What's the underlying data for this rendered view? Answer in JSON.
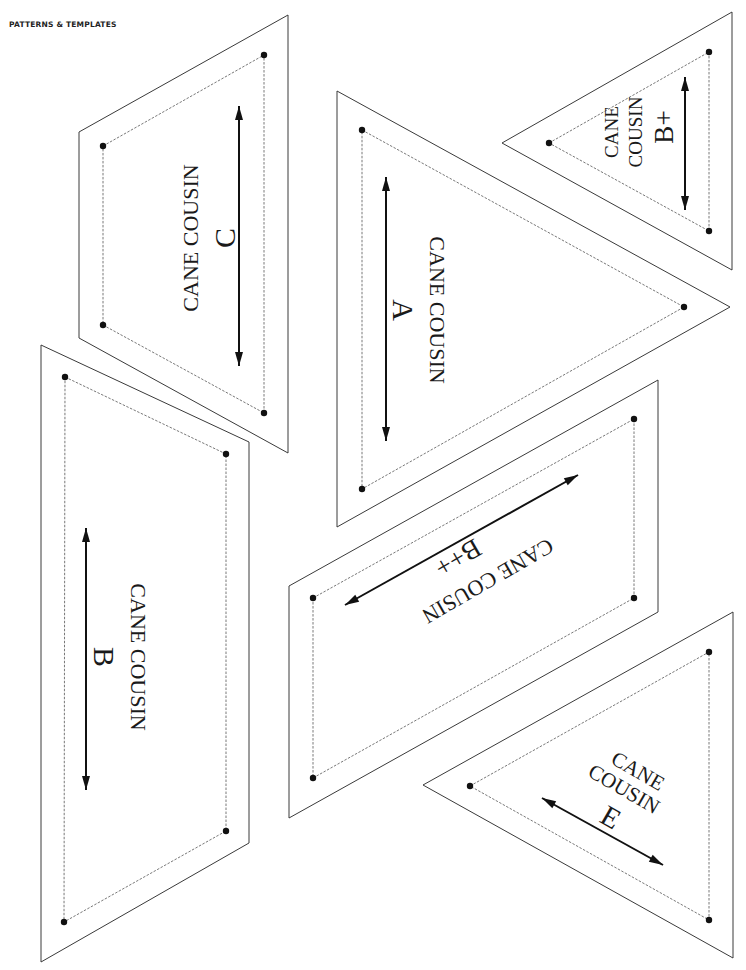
{
  "header": {
    "title": "PATTERNS & TEMPLATES"
  },
  "pieces": [
    {
      "id": "C",
      "name_line1": "CANE COUSIN",
      "name_line2": "C",
      "outer": [
        [
          79,
          132
        ],
        [
          288,
          15
        ],
        [
          288,
          453
        ],
        [
          79,
          338
        ]
      ],
      "inner": [
        [
          103,
          146
        ],
        [
          264,
          55
        ],
        [
          264,
          413
        ],
        [
          103,
          325
        ]
      ],
      "grain": [
        [
          239,
          106
        ],
        [
          239,
          366
        ]
      ],
      "labels": [
        {
          "text_key": "name_line1",
          "x": 190,
          "y": 238,
          "size": 22,
          "rotate": -90
        },
        {
          "text_key": "name_line2",
          "x": 224,
          "y": 238,
          "size": 30,
          "rotate": -90
        }
      ]
    },
    {
      "id": "A",
      "name_line1": "CANE COUSIN",
      "name_line2": "A",
      "outer": [
        [
          337,
          91
        ],
        [
          730,
          307
        ],
        [
          337,
          527
        ]
      ],
      "inner": [
        [
          362,
          130
        ],
        [
          684,
          307
        ],
        [
          362,
          489
        ]
      ],
      "grain": [
        [
          386,
          177
        ],
        [
          386,
          441
        ]
      ],
      "labels": [
        {
          "text_key": "name_line1",
          "x": 437,
          "y": 310,
          "size": 22,
          "rotate": 90
        },
        {
          "text_key": "name_line2",
          "x": 403,
          "y": 310,
          "size": 30,
          "rotate": 90
        }
      ]
    },
    {
      "id": "B+",
      "name_line1": "CANE",
      "name_line2": "COUSIN",
      "name_line3": "B+",
      "outer": [
        [
          502,
          143
        ],
        [
          732,
          12
        ],
        [
          732,
          270
        ]
      ],
      "inner": [
        [
          549,
          143
        ],
        [
          709,
          52
        ],
        [
          709,
          231
        ]
      ],
      "grain": [
        [
          685,
          77
        ],
        [
          685,
          210
        ]
      ],
      "labels": [
        {
          "text_key": "name_line1",
          "x": 611,
          "y": 132,
          "size": 19,
          "rotate": -90
        },
        {
          "text_key": "name_line2",
          "x": 635,
          "y": 132,
          "size": 19,
          "rotate": -90
        },
        {
          "text_key": "name_line3",
          "x": 664,
          "y": 127,
          "size": 27,
          "rotate": -90
        }
      ]
    },
    {
      "id": "B",
      "name_line1": "CANE COUSIN",
      "name_line2": "B",
      "outer": [
        [
          41,
          345
        ],
        [
          249,
          442
        ],
        [
          249,
          843
        ],
        [
          41,
          962
        ]
      ],
      "inner": [
        [
          65,
          377
        ],
        [
          226,
          454
        ],
        [
          226,
          831
        ],
        [
          64,
          922
        ]
      ],
      "grain": [
        [
          86,
          528
        ],
        [
          86,
          790
        ]
      ],
      "labels": [
        {
          "text_key": "name_line1",
          "x": 138,
          "y": 657,
          "size": 22,
          "rotate": 90
        },
        {
          "text_key": "name_line2",
          "x": 104,
          "y": 657,
          "size": 30,
          "rotate": 90
        }
      ]
    },
    {
      "id": "B++",
      "name_line1": "CANE COUSIN",
      "name_line2": "B++",
      "outer": [
        [
          289,
          586
        ],
        [
          658,
          380
        ],
        [
          658,
          612
        ],
        [
          289,
          818
        ]
      ],
      "inner": [
        [
          313,
          598
        ],
        [
          634,
          419
        ],
        [
          634,
          598
        ],
        [
          313,
          778
        ]
      ],
      "grain": [
        [
          345,
          605
        ],
        [
          578,
          475
        ]
      ],
      "labels": [
        {
          "text_key": "name_line1",
          "x": 488,
          "y": 581,
          "size": 22,
          "rotate": 150
        },
        {
          "text_key": "name_line2",
          "x": 458,
          "y": 558,
          "size": 27,
          "rotate": 150
        }
      ]
    },
    {
      "id": "E",
      "name_line1": "CANE",
      "name_line2": "COUSIN",
      "name_line3": "E",
      "outer": [
        [
          423,
          785
        ],
        [
          733,
          612
        ],
        [
          733,
          958
        ]
      ],
      "inner": [
        [
          470,
          786
        ],
        [
          709,
          652
        ],
        [
          709,
          920
        ]
      ],
      "grain": [
        [
          542,
          798
        ],
        [
          663,
          865
        ]
      ],
      "labels": [
        {
          "text_key": "name_line1",
          "x": 638,
          "y": 771,
          "size": 21,
          "rotate": 30
        },
        {
          "text_key": "name_line2",
          "x": 624,
          "y": 789,
          "size": 21,
          "rotate": 30
        },
        {
          "text_key": "name_line3",
          "x": 611,
          "y": 817,
          "size": 29,
          "rotate": 30
        }
      ]
    }
  ]
}
